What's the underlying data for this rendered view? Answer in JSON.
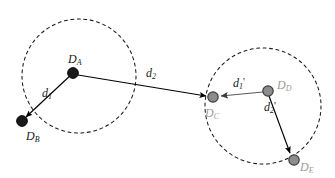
{
  "figure": {
    "kind": "diagram",
    "width": 335,
    "height": 178,
    "background_color": "#ffffff"
  },
  "colors": {
    "background": "#ffffff",
    "dark_node_fill": "#1a1a1a",
    "dark_node_stroke": "#000000",
    "gray_node_fill": "#8c8c8c",
    "gray_node_stroke": "#3d3d3d",
    "edge_dark": "#000000",
    "edge_gray": "#5a5a5a",
    "circle_stroke": "#1a1a1a",
    "label_dark": "#1a1a1a",
    "label_gray": "#9a9a9a"
  },
  "clusters": [
    {
      "id": "cluster-left",
      "name": "left-cluster",
      "cx": 79,
      "cy": 76,
      "r": 57,
      "style": "dashed",
      "stroke_color": "#1a1a1a",
      "dash_pattern": "3 3.5"
    },
    {
      "id": "cluster-right",
      "name": "right-cluster",
      "cx": 263,
      "cy": 106,
      "r": 58,
      "style": "dashed",
      "stroke_color": "#1a1a1a",
      "dash_pattern": "3 3.5"
    }
  ],
  "nodes": [
    {
      "id": "node-da",
      "label": "D",
      "subscript": "A",
      "x": 73,
      "y": 73,
      "r": 5.4,
      "tone": "dark",
      "label_x": 68,
      "label_y": 52,
      "label_color": "#1a1a1a"
    },
    {
      "id": "node-db",
      "label": "D",
      "subscript": "B",
      "x": 22,
      "y": 121,
      "r": 5.4,
      "tone": "dark",
      "label_x": 26,
      "label_y": 129,
      "label_color": "#1a1a1a"
    },
    {
      "id": "node-dc",
      "label": "D",
      "subscript": "C",
      "x": 213,
      "y": 97,
      "r": 5.2,
      "tone": "gray",
      "label_x": 205,
      "label_y": 106,
      "label_color": "#9a9a9a"
    },
    {
      "id": "node-dd",
      "label": "D",
      "subscript": "D",
      "x": 268,
      "y": 91,
      "r": 5.2,
      "tone": "gray",
      "label_x": 277,
      "label_y": 78,
      "label_color": "#9a9a9a"
    },
    {
      "id": "node-de",
      "label": "D",
      "subscript": "E",
      "x": 294,
      "y": 160,
      "r": 5.2,
      "tone": "gray",
      "label_x": 300,
      "label_y": 160,
      "label_color": "#9a9a9a"
    }
  ],
  "edges": [
    {
      "id": "edge-d1",
      "name": "edge-da-to-db",
      "from": "node-da",
      "to": "node-db",
      "x1": 73,
      "y1": 73,
      "x2": 26,
      "y2": 117,
      "tone": "dark",
      "arrow": "end",
      "label": "d",
      "subscript": "1",
      "prime": "",
      "label_x": 42,
      "label_y": 86,
      "label_color": "#1a1a1a"
    },
    {
      "id": "edge-d2",
      "name": "edge-da-to-dc",
      "from": "node-da",
      "to": "node-dc",
      "x1": 78,
      "y1": 75,
      "x2": 206,
      "y2": 96,
      "tone": "dark",
      "arrow": "end",
      "label": "d",
      "subscript": "2",
      "prime": "",
      "label_x": 146,
      "label_y": 66,
      "label_color": "#1a1a1a"
    },
    {
      "id": "edge-d1-prime",
      "name": "edge-dd-to-dc",
      "from": "node-dd",
      "to": "node-dc",
      "x1": 263,
      "y1": 92,
      "x2": 221,
      "y2": 96,
      "tone": "gray",
      "arrow": "end",
      "label": "d",
      "subscript": "1",
      "prime": "'",
      "label_x": 233,
      "label_y": 75,
      "label_color": "#1a1a1a"
    },
    {
      "id": "edge-d2-prime",
      "name": "edge-dd-to-de",
      "from": "node-dd",
      "to": "node-de",
      "x1": 269,
      "y1": 96,
      "x2": 290,
      "y2": 153,
      "tone": "dark",
      "arrow": "end",
      "label": "d",
      "subscript": "2",
      "prime": "'",
      "label_x": 264,
      "label_y": 99,
      "label_color": "#1a1a1a"
    }
  ]
}
